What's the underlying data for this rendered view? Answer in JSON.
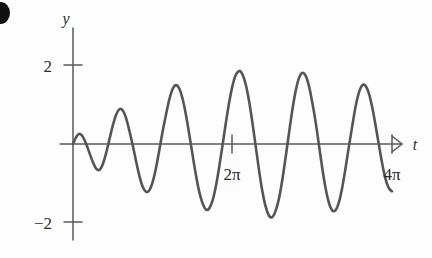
{
  "figure": {
    "kind": "mathematical-plot",
    "background_color": "#fdfdfd",
    "curve_color": "#555557",
    "axis_color": "#58595b"
  },
  "axes": {
    "vertical_label": "y",
    "horizontal_label": "t",
    "y_ticks": [
      {
        "label": "2",
        "value": 2
      },
      {
        "label": "−2",
        "value": -2
      }
    ],
    "x_ticks": [
      {
        "label": "2π",
        "value": 6.283185
      },
      {
        "label": "4π",
        "value": 12.566371
      }
    ]
  },
  "chart_data": {
    "type": "line",
    "title": "",
    "subtitle": "",
    "xlabel": "t",
    "ylabel": "y",
    "xlim": [
      0,
      13.6
    ],
    "ylim": [
      -2.35,
      2.35
    ],
    "grid": false,
    "legend": null,
    "annotations": [],
    "series": [
      {
        "name": "y(t)",
        "formula": "2*sin(t/2)*sin(6t)",
        "envelope_formula": "2*sin(t/2)",
        "carrier_cycles_per_beat": 6,
        "max_amplitude": 1.9,
        "x": [
          0.0,
          0.13,
          0.26,
          0.39,
          0.52,
          0.65,
          0.79,
          0.92,
          1.05,
          1.18,
          1.31,
          1.44,
          1.57,
          1.7,
          1.83,
          1.96,
          2.09,
          2.22,
          2.36,
          2.49,
          2.62,
          2.75,
          2.88,
          3.01,
          3.14,
          3.27,
          3.4,
          3.53,
          3.67,
          3.8,
          3.93,
          4.06,
          4.19,
          4.32,
          4.45,
          4.58,
          4.71,
          4.84,
          4.97,
          5.11,
          5.24,
          5.37,
          5.5,
          5.63,
          5.76,
          5.89,
          6.02,
          6.15,
          6.28,
          6.41,
          6.55,
          6.68,
          6.81,
          6.94,
          7.07,
          7.2,
          7.33,
          7.46,
          7.59,
          7.72,
          7.85,
          7.98,
          8.12,
          8.25,
          8.38,
          8.51,
          8.64,
          8.77,
          8.9,
          9.03,
          9.16,
          9.29,
          9.42,
          9.56,
          9.69,
          9.82,
          9.95,
          10.08,
          10.21,
          10.34,
          10.47,
          10.6,
          10.73,
          10.86,
          11.0,
          11.13,
          11.26,
          11.39,
          11.52,
          11.65,
          11.78,
          11.91,
          12.04,
          12.17,
          12.3,
          12.44,
          12.57
        ],
        "values": [
          0.0,
          0.18,
          0.26,
          0.18,
          0.0,
          -0.23,
          -0.47,
          -0.63,
          -0.65,
          -0.5,
          -0.22,
          0.13,
          0.47,
          0.74,
          0.88,
          0.85,
          0.66,
          0.34,
          -0.05,
          -0.45,
          -0.82,
          -1.09,
          -1.21,
          -1.17,
          -0.96,
          -0.61,
          -0.16,
          0.31,
          0.76,
          1.14,
          1.4,
          1.49,
          1.4,
          1.14,
          0.74,
          0.25,
          -0.27,
          -0.77,
          -1.2,
          -1.51,
          -1.66,
          -1.63,
          -1.43,
          -1.07,
          -0.59,
          -0.04,
          0.52,
          1.04,
          1.46,
          1.74,
          1.85,
          1.76,
          1.5,
          1.08,
          0.54,
          -0.06,
          -0.66,
          -1.19,
          -1.58,
          -1.81,
          -1.85,
          -1.7,
          -1.37,
          -0.9,
          -0.33,
          0.27,
          0.85,
          1.33,
          1.66,
          1.8,
          1.74,
          1.49,
          1.08,
          0.56,
          -0.02,
          -0.6,
          -1.11,
          -1.48,
          -1.68,
          -1.68,
          -1.49,
          -1.13,
          -0.65,
          -0.11,
          0.44,
          0.93,
          1.29,
          1.48,
          1.48,
          1.3,
          0.96,
          0.52,
          0.03,
          -0.45,
          -0.85,
          -1.11,
          -1.2
        ]
      }
    ]
  },
  "decorations": {
    "corner_mark": "bullet-mark"
  }
}
